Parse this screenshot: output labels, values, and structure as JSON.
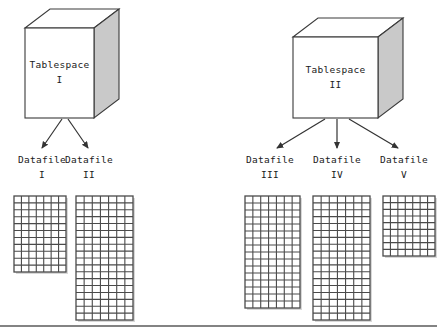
{
  "diagram": {
    "background_color": "#ffffff",
    "line_color": "#3a3a3a",
    "cube_face_color": "#ffffff",
    "cube_side_color": "#c9c9c9",
    "grid_line_color": "#4a4a4a",
    "baseline_color": "#5a5a5a"
  },
  "tablespaces": [
    {
      "name": "tablespace-1",
      "label": "Tablespace",
      "number": "I",
      "front": {
        "x": 25,
        "y": 28,
        "w": 69,
        "h": 90
      },
      "depth": {
        "dx": 25,
        "dy": -19
      },
      "arrows": [
        {
          "name": "arrow-to-datafile-1",
          "x1": 62,
          "y1": 119,
          "x2": 42,
          "y2": 148
        },
        {
          "name": "arrow-to-datafile-2",
          "x1": 68,
          "y1": 119,
          "x2": 88,
          "y2": 148
        }
      ]
    },
    {
      "name": "tablespace-2",
      "label": "Tablespace",
      "number": "II",
      "front": {
        "x": 293,
        "y": 37,
        "w": 85,
        "h": 81
      },
      "depth": {
        "dx": 25,
        "dy": -19
      },
      "arrows": [
        {
          "name": "arrow-to-datafile-3",
          "x1": 325,
          "y1": 119,
          "x2": 277,
          "y2": 148
        },
        {
          "name": "arrow-to-datafile-4",
          "x1": 337,
          "y1": 119,
          "x2": 337,
          "y2": 148
        },
        {
          "name": "arrow-to-datafile-5",
          "x1": 349,
          "y1": 119,
          "x2": 398,
          "y2": 148
        }
      ]
    }
  ],
  "datafiles": [
    {
      "name": "datafile-1",
      "label": "Datafile",
      "number": "I",
      "label_x": 9,
      "label_y": 152,
      "label_w": 66,
      "grid": {
        "x": 14,
        "y": 196,
        "w": 52,
        "h": 76,
        "cols": 7,
        "rows": 11
      }
    },
    {
      "name": "datafile-2",
      "label": "Datafile",
      "number": "II",
      "label_x": 56,
      "label_y": 152,
      "label_w": 66,
      "grid": {
        "x": 76,
        "y": 196,
        "w": 57,
        "h": 124,
        "cols": 7,
        "rows": 18
      }
    },
    {
      "name": "datafile-3",
      "label": "Datafile",
      "number": "III",
      "label_x": 237,
      "label_y": 152,
      "label_w": 66,
      "grid": {
        "x": 245,
        "y": 196,
        "w": 55,
        "h": 112,
        "cols": 7,
        "rows": 16
      }
    },
    {
      "name": "datafile-4",
      "label": "Datafile",
      "number": "IV",
      "label_x": 304,
      "label_y": 152,
      "label_w": 66,
      "grid": {
        "x": 313,
        "y": 196,
        "w": 57,
        "h": 124,
        "cols": 7,
        "rows": 18
      }
    },
    {
      "name": "datafile-5",
      "label": "Datafile",
      "number": "V",
      "label_x": 371,
      "label_y": 152,
      "label_w": 66,
      "grid": {
        "x": 383,
        "y": 196,
        "w": 52,
        "h": 60,
        "cols": 7,
        "rows": 9
      }
    }
  ],
  "baseline": {
    "name": "bottom-divider",
    "y": 326,
    "x1": 0,
    "x2": 437
  }
}
